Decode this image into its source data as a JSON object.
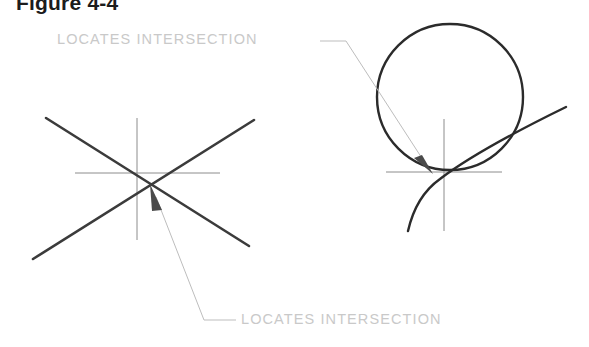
{
  "figure": {
    "title": "Figure 4-4",
    "type": "engineering-drawing",
    "background_color": "#ffffff"
  },
  "labels": {
    "top_callout": "LOCATES INTERSECTION",
    "bottom_callout": "LOCATES INTERSECTION",
    "text_color": "#c9c9c9"
  },
  "colors": {
    "title": "#1c1c1c",
    "object_line": "#3b3b3b",
    "circle_line": "#2b2b2b",
    "center_line": "#8c8c8c",
    "leader_line": "#bdbdbd",
    "arrowhead": "#4a4a4a"
  },
  "diagrams": {
    "left": {
      "name": "crossing-lines-intersection",
      "intersection_point": {
        "x": 147,
        "y": 179
      },
      "lines": [
        {
          "name": "descending-diagonal",
          "x1": 46,
          "y1": 118,
          "x2": 249,
          "y2": 246
        },
        {
          "name": "ascending-diagonal",
          "x1": 33,
          "y1": 259,
          "x2": 254,
          "y2": 120
        }
      ],
      "center_mark": {
        "horizontal": {
          "x1": 75,
          "y1": 173,
          "x2": 220,
          "y2": 173
        },
        "vertical": {
          "x1": 137,
          "y1": 118,
          "x2": 137,
          "y2": 240
        }
      }
    },
    "right": {
      "name": "circle-arc-intersection",
      "intersection_point": {
        "x": 437,
        "y": 175
      },
      "circle": {
        "cx": 450,
        "cy": 97,
        "r": 73
      },
      "arc": {
        "name": "sweeping-arc",
        "start": {
          "x": 408,
          "y": 231
        },
        "end": {
          "x": 566,
          "y": 107
        },
        "control": {
          "x": 455,
          "y": 205
        }
      },
      "center_mark": {
        "horizontal": {
          "x1": 386,
          "y1": 172,
          "x2": 502,
          "y2": 172
        },
        "vertical": {
          "x1": 444,
          "y1": 119,
          "x2": 444,
          "y2": 231
        }
      }
    }
  },
  "leaders": {
    "top": {
      "name": "top-leader-line",
      "shoulder": {
        "x1": 320,
        "y1": 41,
        "x2": 346,
        "y2": 41
      },
      "slant": {
        "x1": 346,
        "y1": 41,
        "x2": 428,
        "y2": 166
      },
      "arrow_tip": {
        "x": 433,
        "y": 174
      }
    },
    "bottom": {
      "name": "bottom-leader-line",
      "slant": {
        "x1": 155,
        "y1": 196,
        "x2": 204,
        "y2": 320
      },
      "shoulder": {
        "x1": 204,
        "y1": 320,
        "x2": 236,
        "y2": 320
      },
      "arrow_tip": {
        "x": 150,
        "y": 184
      }
    }
  }
}
